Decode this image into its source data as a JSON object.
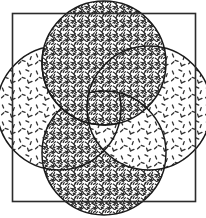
{
  "figure": {
    "title": "Four overlapping circles rosette",
    "background_color": "#ffffff",
    "ink_color": "#1a1a1a"
  },
  "canvas": {
    "width": 206,
    "height": 218
  },
  "frame": {
    "name": "square-border",
    "x": 12.5,
    "y": 13.5,
    "width": 183,
    "height": 188,
    "stroke_color": "#2b2b2b",
    "stroke_width": 1.6,
    "fill": "none"
  },
  "geometry": {
    "center_x": 104,
    "center_y": 108,
    "radius": 62,
    "offset": 45
  },
  "circles": [
    {
      "id": "top",
      "label": "Top circle",
      "cx": 104,
      "cy": 63,
      "r": 62,
      "fill_pattern": "dense-scribble",
      "fill_density": "dark",
      "stack_order": 4,
      "stroke_color": "#1a1a1a"
    },
    {
      "id": "left",
      "label": "Left circle",
      "cx": 59,
      "cy": 108,
      "r": 62,
      "fill_pattern": "sparse-dash",
      "fill_density": "light",
      "stack_order": 1,
      "stroke_color": "#1a1a1a"
    },
    {
      "id": "right",
      "label": "Right circle",
      "cx": 149,
      "cy": 108,
      "r": 62,
      "fill_pattern": "sparse-dash",
      "fill_density": "light",
      "stack_order": 3,
      "stroke_color": "#1a1a1a"
    },
    {
      "id": "bottom",
      "label": "Bottom circle",
      "cx": 104,
      "cy": 153,
      "r": 62,
      "fill_pattern": "dense-scribble",
      "fill_density": "dark",
      "stack_order": 2,
      "stroke_color": "#1a1a1a"
    }
  ],
  "overlaps": [
    {
      "over": "top",
      "under": "left",
      "quadrant": "top-left"
    },
    {
      "over": "top",
      "under": "right",
      "quadrant": "top-right"
    },
    {
      "over": "right",
      "under": "bottom",
      "quadrant": "bottom-right"
    },
    {
      "over": "bottom",
      "under": "left",
      "quadrant": "bottom-left"
    }
  ],
  "patterns": {
    "dense_scribble": {
      "name": "dense-scribble-fill",
      "tile_size": 14,
      "mark_color": "#262626",
      "mark_count": 26,
      "stroke_width": 1.15
    },
    "sparse_dash": {
      "name": "sparse-dash-fill",
      "tile_size": 17,
      "mark_color": "#303030",
      "mark_count": 7,
      "stroke_width": 1.3
    }
  }
}
